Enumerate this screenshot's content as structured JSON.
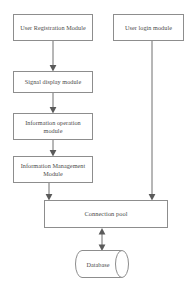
{
  "diagram": {
    "background_color": "#ffffff",
    "line_color": "#6e6e6e",
    "box_border_color": "#8d8d8d",
    "text_color": "#4a4a4a",
    "nodes": [
      {
        "id": "user_registration",
        "label": "User Registration Module",
        "shape": "rectangle"
      },
      {
        "id": "user_login",
        "label": "User login module",
        "shape": "rectangle"
      },
      {
        "id": "signal_display",
        "label": "Signal display module",
        "shape": "rectangle"
      },
      {
        "id": "info_operation",
        "label": "Information operation module",
        "shape": "rectangle"
      },
      {
        "id": "info_management",
        "label": "Information Management Module",
        "shape": "rectangle"
      },
      {
        "id": "connection_pool",
        "label": "Connection pool",
        "shape": "rectangle"
      },
      {
        "id": "database",
        "label": "Database",
        "shape": "cylinder"
      }
    ],
    "edges": [
      {
        "from": "user_registration",
        "to": "signal_display",
        "arrow": "single"
      },
      {
        "from": "signal_display",
        "to": "info_operation",
        "arrow": "single"
      },
      {
        "from": "info_operation",
        "to": "info_management",
        "arrow": "single"
      },
      {
        "from": "info_management",
        "to": "connection_pool",
        "arrow": "single"
      },
      {
        "from": "user_login",
        "to": "connection_pool",
        "arrow": "single"
      },
      {
        "from": "connection_pool",
        "to": "database",
        "arrow": "double"
      }
    ]
  }
}
